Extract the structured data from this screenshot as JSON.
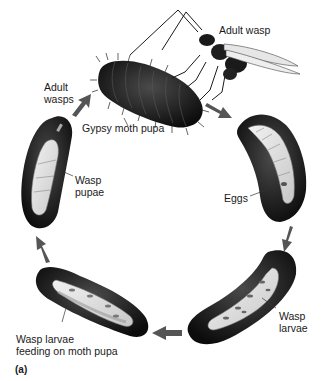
{
  "diagram": {
    "panel_label": "(a)",
    "colors": {
      "body_dark": "#1c1c1c",
      "body_mid": "#3a3a3a",
      "interior_light": "#e8e8e8",
      "interior_grey": "#a8a8a8",
      "arrow": "#555555",
      "background": "#ffffff"
    },
    "stages": [
      {
        "id": "gypsy-moth-pupa",
        "label": "Gypsy moth pupa"
      },
      {
        "id": "adult-wasp",
        "label": "Adult wasp"
      },
      {
        "id": "eggs",
        "label": "Eggs"
      },
      {
        "id": "wasp-larvae",
        "label_line1": "Wasp",
        "label_line2": "larvae"
      },
      {
        "id": "wasp-larvae-feeding",
        "label_line1": "Wasp larvae",
        "label_line2": "feeding on moth pupa"
      },
      {
        "id": "wasp-pupae",
        "label_line1": "Wasp",
        "label_line2": "pupae"
      },
      {
        "id": "adult-wasps",
        "label_line1": "Adult",
        "label_line2": "wasps"
      }
    ],
    "cycle_order": [
      "gypsy-moth-pupa",
      "eggs",
      "wasp-larvae",
      "wasp-larvae-feeding",
      "wasp-pupae",
      "adult-wasps"
    ]
  }
}
